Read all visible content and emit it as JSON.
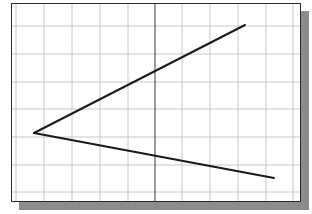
{
  "diagram": {
    "type": "sketch-grid",
    "frame": {
      "x": 11,
      "y": 3,
      "width": 290,
      "height": 199,
      "border_color": "#2a2a2a",
      "shadow_color": "#8c8c8c",
      "shadow_offset": 7
    },
    "grid": {
      "color": "#c8c8c8",
      "vertical_lines": [
        16,
        44,
        72,
        100,
        128,
        182,
        210,
        238,
        266,
        293
      ],
      "horizontal_lines": [
        26,
        54,
        82,
        109,
        137,
        165,
        192
      ],
      "center_line": {
        "x": 155,
        "color": "#3a3a3a"
      }
    },
    "lines": [
      {
        "name": "upper-line",
        "x1": 34,
        "y1": 133,
        "x2": 245,
        "y2": 25,
        "color": "#1a1a1a",
        "width": 2
      },
      {
        "name": "lower-line",
        "x1": 34,
        "y1": 133,
        "x2": 274,
        "y2": 178,
        "color": "#1a1a1a",
        "width": 2
      }
    ],
    "vertex": {
      "x": 34,
      "y": 133
    }
  }
}
